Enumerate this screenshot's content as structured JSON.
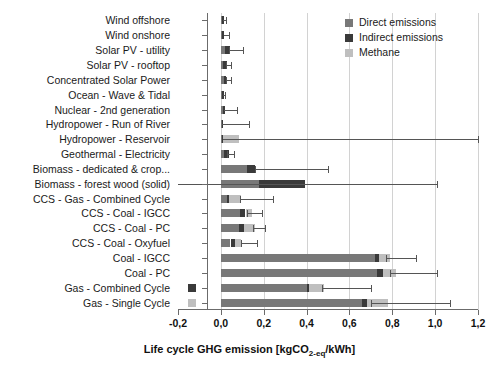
{
  "chart_data": {
    "type": "bar",
    "orientation": "horizontal",
    "stacked": true,
    "title": "",
    "xlabel": "Life cycle GHG emission [kgCO2-eq/kWh]",
    "ylabel": "",
    "xlim": [
      -0.2,
      1.2
    ],
    "xticks": [
      -0.2,
      0.0,
      0.2,
      0.4,
      0.6,
      0.8,
      1.0,
      1.2
    ],
    "xticklabels": [
      "-0,2",
      "0,0",
      "0,2",
      "0,4",
      "0,6",
      "0,8",
      "1,0",
      "1,2"
    ],
    "grid": "vertical",
    "legend_position": "top-right",
    "categories": [
      "Wind offshore",
      "Wind onshore",
      "Solar PV - utility",
      "Solar PV - rooftop",
      "Concentrated Solar Power",
      "Ocean - Wave & Tidal",
      "Nuclear - 2nd generation",
      "Hydropower - Run of River",
      "Hydropower - Reservoir",
      "Geothermal - Electricity",
      "Biomass - dedicated & crop...",
      "Biomass - forest wood (solid)",
      "CCS - Gas - Combined Cycle",
      "CCS - Coal - IGCC",
      "CCS - Coal - PC",
      "CCS - Coal - Oxyfuel",
      "Coal - IGCC",
      "Coal - PC",
      "Gas - Combined Cycle",
      "Gas - Single Cycle"
    ],
    "series": [
      {
        "name": "Direct emissions",
        "color": "#787878",
        "values": [
          0.006,
          0.007,
          0.018,
          0.012,
          0.014,
          0.006,
          0.008,
          0.004,
          0.007,
          0.016,
          0.12,
          0.18,
          0.03,
          0.09,
          0.085,
          0.045,
          0.72,
          0.73,
          0.4,
          0.66
        ]
      },
      {
        "name": "Indirect emissions",
        "color": "#3a3a3a",
        "values": [
          0.009,
          0.009,
          0.026,
          0.016,
          0.011,
          0.007,
          0.01,
          0.004,
          0.005,
          0.02,
          0.04,
          0.215,
          0.01,
          0.025,
          0.025,
          0.022,
          0.018,
          0.028,
          0.01,
          0.02
        ]
      },
      {
        "name": "Methane",
        "color": "#bfbfbf",
        "values": [
          0.0,
          0.0,
          0.0,
          0.0,
          0.0,
          0.0,
          0.0,
          0.0,
          0.075,
          0.0,
          0.0,
          0.0,
          0.055,
          0.03,
          0.048,
          0.028,
          0.05,
          0.06,
          0.07,
          0.1
        ]
      }
    ],
    "error_bars": [
      {
        "category": "Wind offshore",
        "low": 0.012,
        "high": 0.022
      },
      {
        "category": "Wind onshore",
        "low": 0.014,
        "high": 0.036
      },
      {
        "category": "Solar PV - utility",
        "low": 0.04,
        "high": 0.105
      },
      {
        "category": "Solar PV - rooftop",
        "low": 0.026,
        "high": 0.048
      },
      {
        "category": "Concentrated Solar Power",
        "low": 0.024,
        "high": 0.046
      },
      {
        "category": "Ocean - Wave & Tidal",
        "low": 0.012,
        "high": 0.02
      },
      {
        "category": "Nuclear - 2nd generation",
        "low": 0.016,
        "high": 0.075
      },
      {
        "category": "Hydropower - Run of River",
        "low": 0.006,
        "high": 0.13
      },
      {
        "category": "Hydropower - Reservoir",
        "low": 0.01,
        "high": 1.2
      },
      {
        "category": "Geothermal - Electricity",
        "low": 0.03,
        "high": 0.06
      },
      {
        "category": "Biomass - dedicated & crop...",
        "low": 0.16,
        "high": 0.5
      },
      {
        "category": "Biomass - forest wood (solid)",
        "low": -0.22,
        "high": 1.01
      },
      {
        "category": "CCS - Gas - Combined Cycle",
        "low": 0.09,
        "high": 0.245
      },
      {
        "category": "CCS - Coal - IGCC",
        "low": 0.12,
        "high": 0.19
      },
      {
        "category": "CCS - Coal - PC",
        "low": 0.15,
        "high": 0.205
      },
      {
        "category": "CCS - Coal - Oxyfuel",
        "low": 0.095,
        "high": 0.17
      },
      {
        "category": "Coal - IGCC",
        "low": 0.77,
        "high": 0.91
      },
      {
        "category": "Coal - PC",
        "low": 0.79,
        "high": 1.01
      },
      {
        "category": "Gas - Combined Cycle",
        "low": 0.47,
        "high": 0.7
      },
      {
        "category": "Gas - Single Cycle",
        "low": 0.7,
        "high": 1.07
      }
    ],
    "stray_markers": [
      {
        "category": "Gas - Combined Cycle",
        "x": -0.135,
        "color": "#3a3a3a"
      },
      {
        "category": "Gas - Single Cycle",
        "x": -0.135,
        "color": "#bfbfbf"
      }
    ]
  },
  "legend": {
    "items": [
      {
        "label": "Direct emissions",
        "color": "#787878"
      },
      {
        "label": "Indirect emissions",
        "color": "#3a3a3a"
      },
      {
        "label": "Methane",
        "color": "#bfbfbf"
      }
    ]
  },
  "axis_title_parts": {
    "pre": "Life cycle GHG emission [kgCO",
    "sub": "2-eq",
    "post": "/kWh]"
  }
}
